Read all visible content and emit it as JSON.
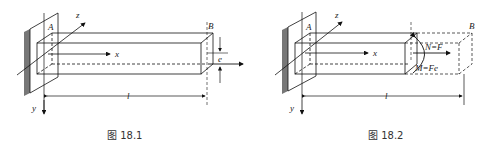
{
  "figures": [
    {
      "id": "18.1",
      "caption": "图 18.1",
      "labels": {
        "A": "A",
        "B": "B",
        "x": "x",
        "y": "y",
        "z": "z",
        "l": "l",
        "e": "e",
        "F": "F"
      }
    },
    {
      "id": "18.2",
      "caption": "图 18.2",
      "labels": {
        "A": "A",
        "B": "B",
        "x": "x",
        "y": "y",
        "z": "z",
        "l": "l",
        "N": "N=F",
        "M": "M=Fe"
      }
    }
  ]
}
